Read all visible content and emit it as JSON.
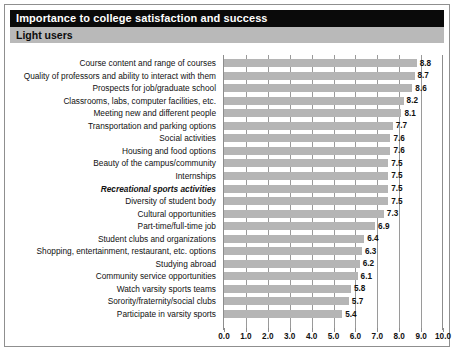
{
  "header": {
    "title": "Importance to college satisfaction and success",
    "subtitle": "Light users"
  },
  "chart_data": {
    "type": "bar",
    "orientation": "horizontal",
    "title": "Importance to college satisfaction and success",
    "subtitle": "Light users",
    "xlabel": "",
    "ylabel": "",
    "xlim": [
      0.0,
      10.0
    ],
    "grid": true,
    "legend": null,
    "bar_color": "#b5b5b5",
    "highlight_category": "Recreational sports activities",
    "tick_labels": [
      "0.0",
      "1.0",
      "2.0",
      "3.0",
      "4.0",
      "5.0",
      "6.0",
      "7.0",
      "8.0",
      "9.0",
      "10.0"
    ],
    "tick_values": [
      0,
      1,
      2,
      3,
      4,
      5,
      6,
      7,
      8,
      9,
      10
    ],
    "categories": [
      "Course content and range of courses",
      "Quality of professors and ability to interact with them",
      "Prospects for job/graduate school",
      "Classrooms, labs, computer facilities, etc.",
      "Meeting new and different people",
      "Transportation and parking options",
      "Social activities",
      "Housing and food options",
      "Beauty of the campus/community",
      "Internships",
      "Recreational sports activities",
      "Diversity of student body",
      "Cultural opportunities",
      "Part-time/full-time job",
      "Student clubs and organizations",
      "Shopping, entertainment, restaurant, etc. options",
      "Studying abroad",
      "Community service opportunities",
      "Watch varsity sports teams",
      "Sorority/fraternity/social clubs",
      "Participate in varsity sports"
    ],
    "values": [
      8.8,
      8.7,
      8.6,
      8.2,
      8.1,
      7.7,
      7.6,
      7.6,
      7.5,
      7.5,
      7.5,
      7.5,
      7.3,
      6.9,
      6.4,
      6.3,
      6.2,
      6.1,
      5.8,
      5.7,
      5.4
    ],
    "value_labels": [
      "8.8",
      "8.7",
      "8.6",
      "8.2",
      "8.1",
      "7.7",
      "7.6",
      "7.6",
      "7.5",
      "7.5",
      "7.5",
      "7.5",
      "7.3",
      "6.9",
      "6.4",
      "6.3",
      "6.2",
      "6.1",
      "5.8",
      "5.7",
      "5.4"
    ]
  }
}
